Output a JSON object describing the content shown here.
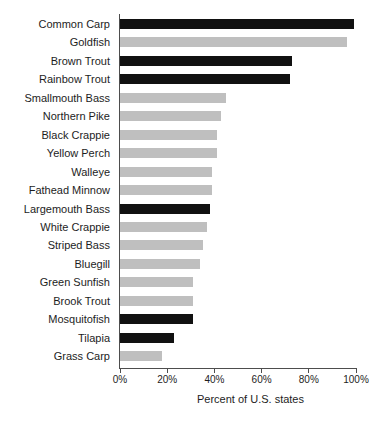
{
  "chart_data": {
    "type": "bar",
    "orientation": "horizontal",
    "title": "",
    "subtitle": "",
    "xlabel": "Percent of U.S. states",
    "ylabel": "",
    "xlim": [
      0,
      100
    ],
    "xticks": [
      0,
      20,
      40,
      60,
      80,
      100
    ],
    "xtick_labels": [
      "0%",
      "20%",
      "40%",
      "60%",
      "80%",
      "100%"
    ],
    "grid": false,
    "legend": null,
    "legend_position": "none",
    "value_unit": "percent",
    "colors": {
      "dark_bar": "#111111",
      "light_bar": "#bfbfbf",
      "axis": "#4d4d4d",
      "text": "#1d1d1d",
      "background": "#ffffff"
    },
    "categories": [
      "Common Carp",
      "Goldfish",
      "Brown Trout",
      "Rainbow Trout",
      "Smallmouth Bass",
      "Northern Pike",
      "Black Crappie",
      "Yellow Perch",
      "Walleye",
      "Fathead Minnow",
      "Largemouth Bass",
      "White Crappie",
      "Striped Bass",
      "Bluegill",
      "Green Sunfish",
      "Brook Trout",
      "Mosquitofish",
      "Tilapia",
      "Grass Carp"
    ],
    "values": [
      99,
      96,
      73,
      72,
      45,
      43,
      41,
      41,
      39,
      39,
      38,
      37,
      35,
      34,
      31,
      31,
      31,
      23,
      18
    ],
    "bar_colors": [
      "#111111",
      "#bfbfbf",
      "#111111",
      "#111111",
      "#bfbfbf",
      "#bfbfbf",
      "#bfbfbf",
      "#bfbfbf",
      "#bfbfbf",
      "#bfbfbf",
      "#111111",
      "#bfbfbf",
      "#bfbfbf",
      "#bfbfbf",
      "#bfbfbf",
      "#bfbfbf",
      "#111111",
      "#111111",
      "#bfbfbf"
    ]
  }
}
